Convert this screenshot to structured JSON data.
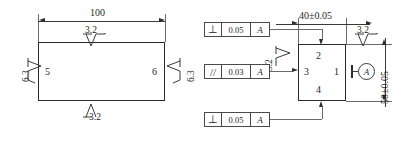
{
  "drawing": {
    "title": "Surface roughness and geometric tolerance drawing",
    "left_view": {
      "name": "front-view",
      "dimensions": [
        {
          "id": "width",
          "label": "100",
          "orientation": "horizontal",
          "position": "top"
        }
      ],
      "surface_labels": [
        {
          "id": "surface-5",
          "label": "5",
          "location": "inside-left"
        },
        {
          "id": "surface-6",
          "label": "6",
          "location": "inside-right"
        }
      ],
      "surface_finish": [
        {
          "id": "ra-top",
          "value": "3.2",
          "location": "top",
          "symbol": "machining-required"
        },
        {
          "id": "ra-bottom",
          "value": "3.2",
          "location": "bottom",
          "symbol": "machining-required"
        },
        {
          "id": "ra-left",
          "value": "6.3",
          "location": "left",
          "symbol": "machining-required"
        },
        {
          "id": "ra-right",
          "value": "6.3",
          "location": "right",
          "symbol": "machining-required"
        }
      ]
    },
    "right_view": {
      "name": "side-view",
      "dimensions": [
        {
          "id": "width",
          "label": "40±0.05",
          "orientation": "horizontal",
          "position": "top"
        },
        {
          "id": "height",
          "label": "50±0.05",
          "orientation": "vertical",
          "position": "right"
        }
      ],
      "surface_labels": [
        {
          "id": "surface-1",
          "label": "1",
          "location": "inside-right"
        },
        {
          "id": "surface-2",
          "label": "2",
          "location": "inside-top"
        },
        {
          "id": "surface-3",
          "label": "3",
          "location": "inside-left"
        },
        {
          "id": "surface-4",
          "label": "4",
          "location": "inside-bottom"
        }
      ],
      "surface_finish": [
        {
          "id": "ra-surface-3",
          "value": "3.2",
          "location": "left",
          "symbol": "machining-required"
        },
        {
          "id": "ra-top-right",
          "value": "3.2",
          "location": "top-right",
          "symbol": "machining-required"
        }
      ],
      "datum": {
        "id": "datum-a",
        "label": "A"
      },
      "feature_control_frames": [
        {
          "id": "fcf-top",
          "characteristic": "perpendicularity",
          "symbol": "⊥",
          "tolerance": "0.05",
          "datum": "A",
          "targets": "surface-2"
        },
        {
          "id": "fcf-middle",
          "characteristic": "parallelism",
          "symbol": "//",
          "tolerance": "0.03",
          "datum": "A",
          "targets": "surface-3"
        },
        {
          "id": "fcf-bottom",
          "characteristic": "perpendicularity",
          "symbol": "⊥",
          "tolerance": "0.05",
          "datum": "A",
          "targets": "surface-4"
        }
      ]
    },
    "colors": {
      "line": "#2b2b2b",
      "thin_line": "#6b6b6b",
      "text": "#1f1f1f",
      "background": "#ffffff"
    }
  }
}
